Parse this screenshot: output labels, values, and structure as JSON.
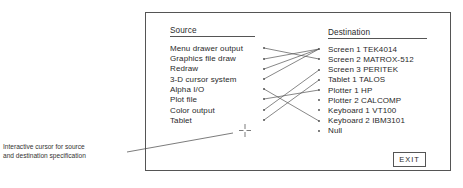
{
  "panel": {
    "source_header": "Source",
    "destination_header": "Destination",
    "sources": [
      "Menu drawer output",
      "Graphics file draw",
      "Redraw",
      "3-D cursor system",
      "Alpha I/O",
      "Plot file",
      "Color output",
      "Tablet"
    ],
    "destinations": [
      "Screen 1 TEK4014",
      "Screen 2 MATROX-512",
      "Screen 3 PERITEK",
      "Tablet 1 TALOS",
      "Plotter 1 HP",
      "Plotter 2 CALCOMP",
      "Keyboard 1 VT100",
      "Keyboard 2 IBM3101",
      "Null"
    ],
    "connections": [
      {
        "source": "Menu drawer output",
        "destination": "Screen 2 MATROX-512"
      },
      {
        "source": "Graphics file draw",
        "destination": "Screen 1 TEK4014"
      },
      {
        "source": "Redraw",
        "destination": "Screen 1 TEK4014"
      },
      {
        "source": "3-D cursor system",
        "destination": "Screen 1 TEK4014"
      },
      {
        "source": "Alpha I/O",
        "destination": "Keyboard 2 IBM3101"
      },
      {
        "source": "Plot file",
        "destination": "Plotter 1 HP"
      },
      {
        "source": "Color output",
        "destination": "Screen 3 PERITEK"
      },
      {
        "source": "Tablet",
        "destination": "Tablet 1 TALOS"
      }
    ],
    "exit_label": "EXIT"
  },
  "callout": {
    "line1": "Interactive cursor for source",
    "line2": "and destination specification"
  }
}
